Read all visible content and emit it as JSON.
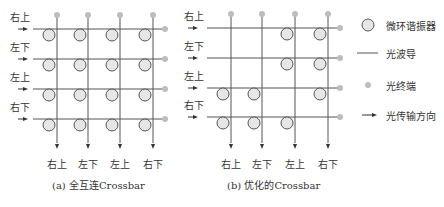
{
  "panel_a": {
    "caption": "(a) 全互连Crossbar",
    "row_labels": [
      "右上",
      "左下",
      "左上",
      "右下"
    ],
    "col_labels": [
      "右上",
      "左下",
      "左上",
      "右下"
    ],
    "rings": [
      [
        1,
        1,
        1,
        1
      ],
      [
        1,
        1,
        1,
        1
      ],
      [
        1,
        1,
        1,
        1
      ],
      [
        1,
        1,
        1,
        1
      ]
    ]
  },
  "panel_b": {
    "caption": "(b) 优化的Crossbar",
    "row_labels": [
      "右上",
      "左下",
      "左上",
      "右下"
    ],
    "col_labels": [
      "右上",
      "左下",
      "左上",
      "右下"
    ],
    "rings": [
      [
        0,
        0,
        1,
        1
      ],
      [
        0,
        0,
        1,
        1
      ],
      [
        1,
        1,
        0,
        1
      ],
      [
        1,
        1,
        1,
        0
      ]
    ]
  },
  "legend": {
    "items": [
      {
        "icon": "microring-icon",
        "label": "微环谐振器"
      },
      {
        "icon": "waveguide-icon",
        "label": "光波导"
      },
      {
        "icon": "terminal-icon",
        "label": "光终端"
      },
      {
        "icon": "arrow-icon",
        "label": "光传输方向"
      }
    ]
  },
  "colors": {
    "line": "#555555",
    "ring_fill": "#e6e6e6",
    "ring_stroke": "#444444",
    "terminal": "#bdbdbd"
  }
}
